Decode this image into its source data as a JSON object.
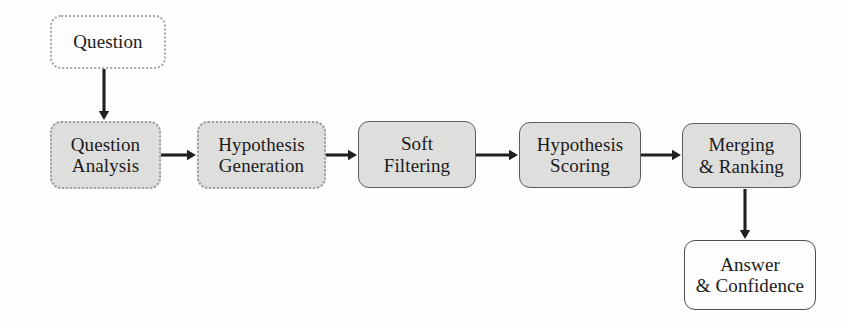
{
  "diagram": {
    "background_color": "#fefefe",
    "fill_color": "#dededd",
    "stroke_color": "#4f4f4f",
    "text_color": "#1b1b1b",
    "nodes": [
      {
        "id": "question",
        "label": "Question",
        "style": "plain-dotted",
        "x": 50,
        "y": 15,
        "w": 116,
        "h": 54
      },
      {
        "id": "question-analysis",
        "label": "Question\nAnalysis",
        "style": "filled-dotted",
        "x": 50,
        "y": 121,
        "w": 111,
        "h": 68
      },
      {
        "id": "hypothesis-generation",
        "label": "Hypothesis\nGeneration",
        "style": "filled-dotted",
        "x": 197,
        "y": 121,
        "w": 129,
        "h": 68
      },
      {
        "id": "soft-filtering",
        "label": "Soft\nFiltering",
        "style": "filled-solid",
        "x": 358,
        "y": 121,
        "w": 118,
        "h": 67
      },
      {
        "id": "hypothesis-scoring",
        "label": "Hypothesis\nScoring",
        "style": "filled-solid",
        "x": 519,
        "y": 122,
        "w": 122,
        "h": 66
      },
      {
        "id": "merging-ranking",
        "label": "Merging\n& Ranking",
        "style": "filled-solid",
        "x": 682,
        "y": 123,
        "w": 119,
        "h": 65
      },
      {
        "id": "answer-confidence",
        "label": "Answer\n& Confidence",
        "style": "plain-solid",
        "x": 684,
        "y": 240,
        "w": 132,
        "h": 70
      }
    ],
    "edges": [
      {
        "id": "question-to-question-analysis",
        "from": "question",
        "to": "question-analysis",
        "direction": "vertical",
        "x1": 104,
        "y1": 69,
        "x2": 104,
        "y2": 120
      },
      {
        "id": "question-analysis-to-hypothesis-generation",
        "from": "question-analysis",
        "to": "hypothesis-generation",
        "direction": "horizontal",
        "x1": 161,
        "y1": 155,
        "x2": 196,
        "y2": 155
      },
      {
        "id": "hypothesis-generation-to-soft-filtering",
        "from": "hypothesis-generation",
        "to": "soft-filtering",
        "direction": "horizontal",
        "x1": 326,
        "y1": 155,
        "x2": 357,
        "y2": 155
      },
      {
        "id": "soft-filtering-to-hypothesis-scoring",
        "from": "soft-filtering",
        "to": "hypothesis-scoring",
        "direction": "horizontal",
        "x1": 476,
        "y1": 155,
        "x2": 518,
        "y2": 155
      },
      {
        "id": "hypothesis-scoring-to-merging-ranking",
        "from": "hypothesis-scoring",
        "to": "merging-ranking",
        "direction": "horizontal",
        "x1": 641,
        "y1": 155,
        "x2": 681,
        "y2": 155
      },
      {
        "id": "merging-ranking-to-answer-confidence",
        "from": "merging-ranking",
        "to": "answer-confidence",
        "direction": "vertical",
        "x1": 745,
        "y1": 189,
        "x2": 745,
        "y2": 239
      }
    ]
  }
}
